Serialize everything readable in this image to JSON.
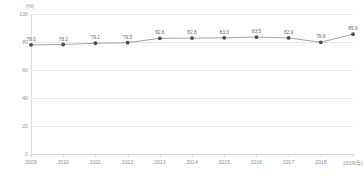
{
  "chart_data": {
    "type": "line",
    "title": "",
    "subtitle": "",
    "xlabel": "",
    "ylabel": "",
    "unit_label": "(%)",
    "x_axis_suffix_label": "2019(年)",
    "categories": [
      "2009",
      "2010",
      "2011",
      "2012",
      "2013",
      "2014",
      "2015",
      "2016",
      "2017",
      "2018",
      "2019(年)"
    ],
    "values": [
      78.0,
      78.2,
      79.1,
      79.5,
      82.6,
      82.8,
      83.0,
      83.5,
      82.9,
      79.8,
      85.6
    ],
    "point_labels": [
      "78.0",
      "78.2",
      "79.1",
      "79.5",
      "82.6",
      "82.8",
      "83.0",
      "83.5",
      "82.9",
      "79.8",
      "85.6"
    ],
    "ylim": [
      0,
      100
    ],
    "yticks": [
      0,
      20,
      40,
      60,
      80,
      100
    ],
    "ytick_labels": [
      "0",
      "20",
      "40",
      "60",
      "80",
      "100"
    ],
    "grid": true,
    "legend": false,
    "legend_position": "none",
    "series": [
      {
        "name": "",
        "values": [
          78.0,
          78.2,
          79.1,
          79.5,
          82.6,
          82.8,
          83.0,
          83.5,
          82.9,
          79.8,
          85.6
        ],
        "line_color": "#9a9a9a",
        "marker_color": "#4a4a4a",
        "marker_shape": "circle"
      }
    ],
    "colors": {
      "line": "#9a9a9a",
      "marker": "#4a4a4a",
      "grid": "#e9e9e9",
      "axis": "#d8d8d8",
      "tick_text": "#8f8f8f",
      "value_text": "#6d6d6d",
      "background": "#ffffff"
    }
  }
}
